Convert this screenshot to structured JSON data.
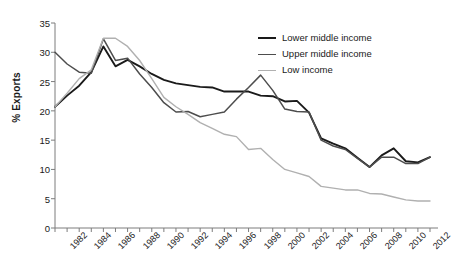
{
  "chart_data": {
    "type": "line",
    "title": "",
    "xlabel": "",
    "ylabel": "% Exports",
    "ylim": [
      0,
      35
    ],
    "ytick_values": [
      0,
      5,
      10,
      15,
      20,
      25,
      30,
      35
    ],
    "xlim": [
      1982,
      2013
    ],
    "grid": false,
    "legend_position": "top-right",
    "x": [
      1982,
      1983,
      1984,
      1985,
      1986,
      1987,
      1988,
      1989,
      1990,
      1991,
      1992,
      1993,
      1994,
      1995,
      1996,
      1997,
      1998,
      1999,
      2000,
      2001,
      2002,
      2003,
      2004,
      2005,
      2006,
      2007,
      2008,
      2009,
      2010,
      2011,
      2012,
      2013
    ],
    "x_tick_labels": [
      "1982",
      "",
      "1984",
      "",
      "1986",
      "",
      "1988",
      "",
      "1990",
      "",
      "1992",
      "",
      "1994",
      "",
      "1996",
      "",
      "1998",
      "",
      "2000",
      "",
      "2002",
      "",
      "2004",
      "",
      "2006",
      "",
      "2008",
      "",
      "2010",
      "",
      "2012",
      ""
    ],
    "series": [
      {
        "name": "Lower middle income",
        "color": "#1a1a1a",
        "width": 1.9,
        "values": [
          20.7,
          22.6,
          24.3,
          26.6,
          31.0,
          27.6,
          28.7,
          27.6,
          26.3,
          25.3,
          24.7,
          24.4,
          24.1,
          24.0,
          23.3,
          23.3,
          23.3,
          22.6,
          22.5,
          21.6,
          21.7,
          19.7,
          15.3,
          14.4,
          13.6,
          12.0,
          10.4,
          12.4,
          13.6,
          11.4,
          11.2,
          12.1
        ]
      },
      {
        "name": "Upper middle income",
        "color": "#4d4d4d",
        "width": 1.5,
        "values": [
          30.0,
          28.0,
          26.6,
          26.4,
          32.3,
          28.6,
          29.0,
          26.3,
          24.0,
          21.4,
          19.8,
          19.9,
          19.0,
          19.4,
          19.8,
          22.0,
          24.0,
          26.1,
          23.5,
          20.3,
          19.9,
          19.8,
          15.0,
          14.0,
          13.4,
          11.9,
          10.4,
          12.1,
          12.1,
          11.0,
          11.0,
          12.1
        ]
      },
      {
        "name": "Low income",
        "color": "#b0b0b0",
        "width": 1.4,
        "values": [
          20.7,
          23.0,
          25.5,
          27.0,
          32.4,
          32.4,
          31.0,
          28.6,
          25.5,
          22.3,
          20.7,
          19.4,
          18.0,
          17.0,
          16.0,
          15.6,
          13.4,
          13.6,
          11.7,
          10.0,
          9.4,
          8.8,
          7.1,
          6.8,
          6.5,
          6.5,
          5.9,
          5.8,
          5.3,
          4.8,
          4.6,
          4.6
        ]
      }
    ]
  },
  "legend": {
    "items": [
      {
        "label": "Lower middle income"
      },
      {
        "label": "Upper middle income"
      },
      {
        "label": "Low income"
      }
    ]
  },
  "axes": {
    "y_title": "% Exports"
  }
}
